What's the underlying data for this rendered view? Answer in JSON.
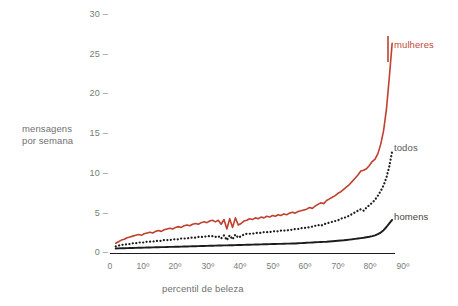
{
  "chart_data": {
    "type": "line",
    "title": "",
    "xlabel": "percentil de beleza",
    "ylabel": "mensagens por semana",
    "ylabel_line1": "mensagens",
    "ylabel_line2": "por semana",
    "xlim": [
      0,
      100
    ],
    "ylim": [
      0,
      30
    ],
    "grid": false,
    "legend_position": "right-inline",
    "y_ticks": [
      0,
      5,
      10,
      15,
      20,
      25,
      30
    ],
    "y_tick_labels": [
      "0",
      "5",
      "10",
      "15",
      "20",
      "25",
      "30"
    ],
    "x_ticks": [
      0,
      10,
      20,
      30,
      40,
      50,
      60,
      70,
      80,
      90
    ],
    "x_tick_labels": [
      "0",
      "10º",
      "20º",
      "30º",
      "40º",
      "50º",
      "60º",
      "70º",
      "80º",
      "90º"
    ],
    "colors": {
      "mulheres": "#c0402f",
      "todos": "#1c1c1c",
      "homens": "#1c1c1c",
      "axis": "#1c1c1c",
      "tick_text": "#7a7a7a",
      "label_text": "#6f6f6f"
    },
    "x": [
      2,
      3,
      4,
      5,
      6,
      7,
      8,
      9,
      10,
      11,
      12,
      13,
      14,
      15,
      16,
      17,
      18,
      19,
      20,
      21,
      22,
      23,
      24,
      25,
      26,
      27,
      28,
      29,
      30,
      31,
      32,
      33,
      34,
      35,
      36,
      37,
      38,
      39,
      40,
      41,
      42,
      43,
      44,
      45,
      46,
      47,
      48,
      49,
      50,
      51,
      52,
      53,
      54,
      55,
      56,
      57,
      58,
      59,
      60,
      61,
      62,
      63,
      64,
      65,
      66,
      67,
      68,
      69,
      70,
      71,
      72,
      73,
      74,
      75,
      76,
      77,
      78,
      79,
      80,
      81,
      82,
      83,
      84,
      85,
      86,
      87,
      88,
      89,
      90,
      91,
      92,
      93,
      94,
      95,
      96,
      97,
      98,
      99
    ],
    "series": [
      {
        "name": "mulheres",
        "style": "solid",
        "color": "#c0402f",
        "values": [
          1.1,
          1.3,
          1.5,
          1.6,
          1.8,
          1.9,
          2.0,
          2.1,
          2.2,
          2.1,
          2.3,
          2.4,
          2.5,
          2.4,
          2.6,
          2.7,
          2.6,
          2.8,
          2.9,
          3.0,
          2.9,
          3.1,
          3.2,
          3.1,
          3.3,
          3.4,
          3.3,
          3.5,
          3.6,
          3.5,
          3.7,
          3.8,
          3.7,
          3.9,
          4.0,
          3.8,
          4.0,
          3.5,
          4.1,
          2.9,
          4.2,
          3.1,
          4.3,
          3.4,
          3.6,
          3.9,
          4.0,
          4.2,
          4.1,
          4.3,
          4.2,
          4.4,
          4.3,
          4.5,
          4.4,
          4.6,
          4.5,
          4.7,
          4.6,
          4.8,
          4.7,
          4.9,
          5.0,
          4.9,
          5.1,
          5.2,
          5.3,
          5.4,
          5.6,
          5.5,
          5.8,
          6.0,
          6.2,
          6.1,
          6.5,
          6.7,
          6.9,
          7.1,
          7.4,
          7.6,
          7.9,
          8.2,
          8.5,
          8.9,
          9.3,
          9.7,
          10.2,
          10.3,
          10.5,
          10.9,
          11.4,
          11.7,
          12.4,
          13.6,
          15.3,
          18.0,
          22.0,
          26.3
        ]
      },
      {
        "name": "todos",
        "style": "dotted",
        "color": "#1c1c1c",
        "values": [
          0.7,
          0.8,
          0.9,
          0.9,
          1.0,
          1.0,
          1.1,
          1.1,
          1.2,
          1.2,
          1.2,
          1.3,
          1.3,
          1.3,
          1.4,
          1.4,
          1.4,
          1.5,
          1.5,
          1.5,
          1.6,
          1.6,
          1.6,
          1.7,
          1.7,
          1.7,
          1.8,
          1.8,
          1.8,
          1.9,
          1.9,
          1.9,
          2.0,
          2.0,
          2.0,
          1.9,
          2.0,
          1.7,
          2.1,
          1.5,
          2.1,
          1.6,
          2.2,
          1.8,
          2.0,
          2.2,
          2.3,
          2.3,
          2.3,
          2.4,
          2.4,
          2.4,
          2.5,
          2.5,
          2.5,
          2.6,
          2.6,
          2.6,
          2.7,
          2.7,
          2.7,
          2.8,
          2.8,
          2.9,
          2.9,
          3.0,
          3.0,
          3.1,
          3.1,
          3.2,
          3.3,
          3.4,
          3.3,
          3.5,
          3.6,
          3.7,
          3.8,
          3.9,
          4.0,
          4.2,
          4.3,
          4.4,
          4.6,
          4.8,
          5.0,
          5.2,
          5.4,
          5.2,
          5.6,
          5.9,
          6.2,
          6.6,
          7.1,
          7.7,
          8.4,
          9.4,
          10.8,
          12.7
        ]
      },
      {
        "name": "homens",
        "style": "solid",
        "color": "#1c1c1c",
        "values": [
          0.45,
          0.46,
          0.47,
          0.48,
          0.49,
          0.5,
          0.51,
          0.52,
          0.53,
          0.54,
          0.55,
          0.56,
          0.57,
          0.58,
          0.59,
          0.6,
          0.61,
          0.62,
          0.63,
          0.64,
          0.65,
          0.66,
          0.67,
          0.68,
          0.69,
          0.7,
          0.71,
          0.72,
          0.73,
          0.74,
          0.75,
          0.76,
          0.77,
          0.78,
          0.79,
          0.8,
          0.81,
          0.82,
          0.83,
          0.84,
          0.85,
          0.86,
          0.87,
          0.88,
          0.89,
          0.9,
          0.91,
          0.92,
          0.93,
          0.94,
          0.95,
          0.96,
          0.97,
          0.98,
          0.99,
          1.0,
          1.01,
          1.02,
          1.03,
          1.04,
          1.05,
          1.06,
          1.07,
          1.08,
          1.1,
          1.12,
          1.14,
          1.16,
          1.18,
          1.2,
          1.22,
          1.24,
          1.26,
          1.28,
          1.3,
          1.33,
          1.36,
          1.39,
          1.42,
          1.45,
          1.48,
          1.52,
          1.56,
          1.6,
          1.65,
          1.7,
          1.75,
          1.8,
          1.86,
          1.92,
          2.0,
          2.1,
          2.25,
          2.45,
          2.75,
          3.15,
          3.6,
          4.05
        ]
      }
    ]
  },
  "labels": {
    "mulheres": "mulheres",
    "todos": "todos",
    "homens": "homens"
  }
}
